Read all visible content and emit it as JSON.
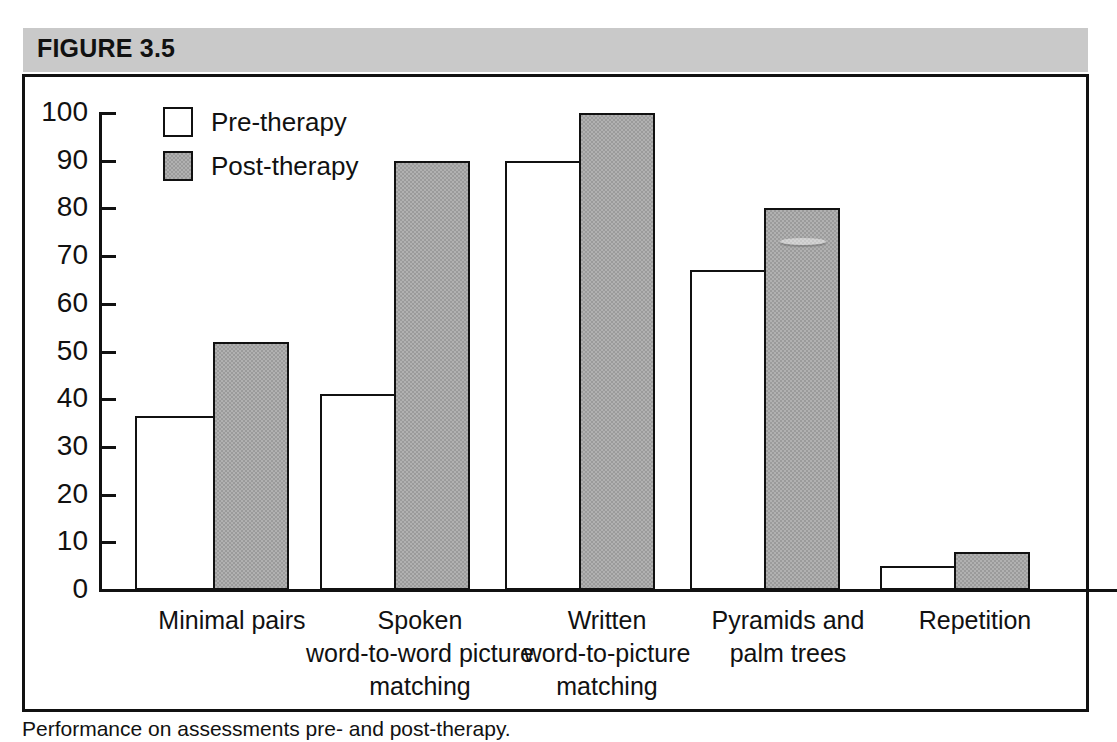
{
  "figure": {
    "header_label": "FIGURE 3.5",
    "caption": "Performance on assessments pre- and post-therapy."
  },
  "legend": {
    "position": "inside-top-left",
    "items": [
      {
        "label": "Pre-therapy",
        "swatch": "white-square",
        "color": "#ffffff"
      },
      {
        "label": "Post-therapy",
        "swatch": "gray-square",
        "color": "#9b9b9b"
      }
    ]
  },
  "axis": {
    "y_ticks": [
      "100",
      "90",
      "80",
      "70",
      "60",
      "50",
      "40",
      "30",
      "20",
      "10",
      "0"
    ]
  },
  "chart_data": {
    "type": "bar",
    "title": "FIGURE 3.5",
    "xlabel": "",
    "ylabel": "",
    "ylim": [
      0,
      100
    ],
    "ytick_step": 10,
    "grid": false,
    "legend_position": "upper left (inside plot)",
    "categories": [
      "Minimal pairs",
      "Spoken word-to-word picture matching",
      "Written word-to-picture matching",
      "Pyramids and palm trees",
      "Repetition"
    ],
    "category_lines": [
      [
        "Minimal pairs"
      ],
      [
        "Spoken",
        "word-to-word picture",
        "matching"
      ],
      [
        "Written",
        "word-to-picture",
        "matching"
      ],
      [
        "Pyramids and",
        "palm trees"
      ],
      [
        "Repetition"
      ]
    ],
    "series": [
      {
        "name": "Pre-therapy",
        "color": "#ffffff",
        "values": [
          36.5,
          41,
          90,
          67,
          5
        ]
      },
      {
        "name": "Post-therapy",
        "color": "#9b9b9b",
        "values": [
          52,
          90,
          100,
          80,
          8
        ]
      }
    ]
  }
}
